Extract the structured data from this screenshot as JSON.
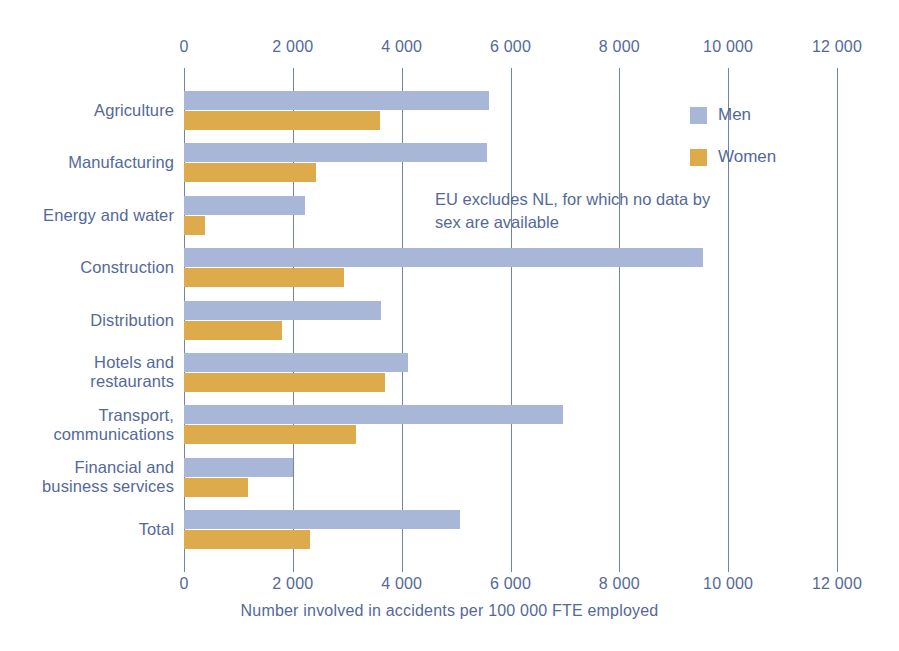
{
  "chart_data": {
    "type": "bar",
    "orientation": "horizontal",
    "title": "",
    "subtitle": "",
    "xlabel": "Number involved in accidents per 100 000 FTE employed",
    "ylabel": "",
    "xlim": [
      0,
      12000
    ],
    "xticks": [
      0,
      2000,
      4000,
      6000,
      8000,
      10000,
      12000
    ],
    "xticklabels": [
      "0",
      "2 000",
      "4 000",
      "6 000",
      "8 000",
      "10 000",
      "12 000"
    ],
    "grid": true,
    "grid_axis": "x",
    "legend_position": "upper right",
    "categories": [
      "Agriculture",
      "Manufacturing",
      "Energy and water",
      "Construction",
      "Hotels and\nrestaurants",
      "Distribution",
      "Transport,\ncommunications",
      "Financial and\nbusiness services",
      "Total"
    ],
    "category_order": [
      "Agriculture",
      "Manufacturing",
      "Energy and water",
      "Construction",
      "Distribution",
      "Hotels and restaurants",
      "Transport, communications",
      "Financial and business services",
      "Total"
    ],
    "series": [
      {
        "name": "Men",
        "color": "#a8b6d8",
        "values": [
          5600,
          5570,
          2220,
          9540,
          3620,
          4110,
          6960,
          2000,
          5070
        ]
      },
      {
        "name": "Women",
        "color": "#ddab4c",
        "values": [
          3600,
          2420,
          380,
          2940,
          1800,
          3700,
          3160,
          1180,
          2320
        ]
      }
    ],
    "annotations": [
      "EU excludes NL, for which no data by sex are available"
    ]
  },
  "axis": {
    "tick_labels": [
      "0",
      "2 000",
      "4 000",
      "6 000",
      "8 000",
      "10 000",
      "12 000"
    ],
    "title": "Number involved in accidents per 100 000 FTE employed"
  },
  "categories": [
    {
      "label": "Agriculture",
      "lines": [
        "Agriculture"
      ]
    },
    {
      "label": "Manufacturing",
      "lines": [
        "Manufacturing"
      ]
    },
    {
      "label": "Energy and water",
      "lines": [
        "Energy and water"
      ]
    },
    {
      "label": "Construction",
      "lines": [
        "Construction"
      ]
    },
    {
      "label": "Distribution",
      "lines": [
        "Distribution"
      ]
    },
    {
      "label": "Hotels and restaurants",
      "lines": [
        "Hotels and",
        "restaurants"
      ]
    },
    {
      "label": "Transport, communications",
      "lines": [
        "Transport,",
        "communications"
      ]
    },
    {
      "label": "Financial and business services",
      "lines": [
        "Financial and",
        "business services"
      ]
    },
    {
      "label": "Total",
      "lines": [
        "Total"
      ]
    }
  ],
  "category_lines": {
    "r0l0": "Agriculture",
    "r1l0": "Manufacturing",
    "r2l0": "Energy and water",
    "r3l0": "Construction",
    "r4l0": "Distribution",
    "r5l0": "Hotels and",
    "r5l1": "restaurants",
    "r6l0": "Transport,",
    "r6l1": "communications",
    "r7l0": "Financial and",
    "r7l1": "business services",
    "r8l0": "Total"
  },
  "legend": {
    "items": [
      {
        "label": "Men",
        "color": "#a8b6d8"
      },
      {
        "label": "Women",
        "color": "#ddab4c"
      }
    ]
  },
  "note": {
    "line1": "EU excludes NL, for which no data by",
    "line2": "sex are available"
  },
  "colors": {
    "men": "#a8b6d8",
    "women": "#ddab4c",
    "text": "#54699a",
    "gridline": "#6f84ad",
    "background": "#ffffff"
  }
}
